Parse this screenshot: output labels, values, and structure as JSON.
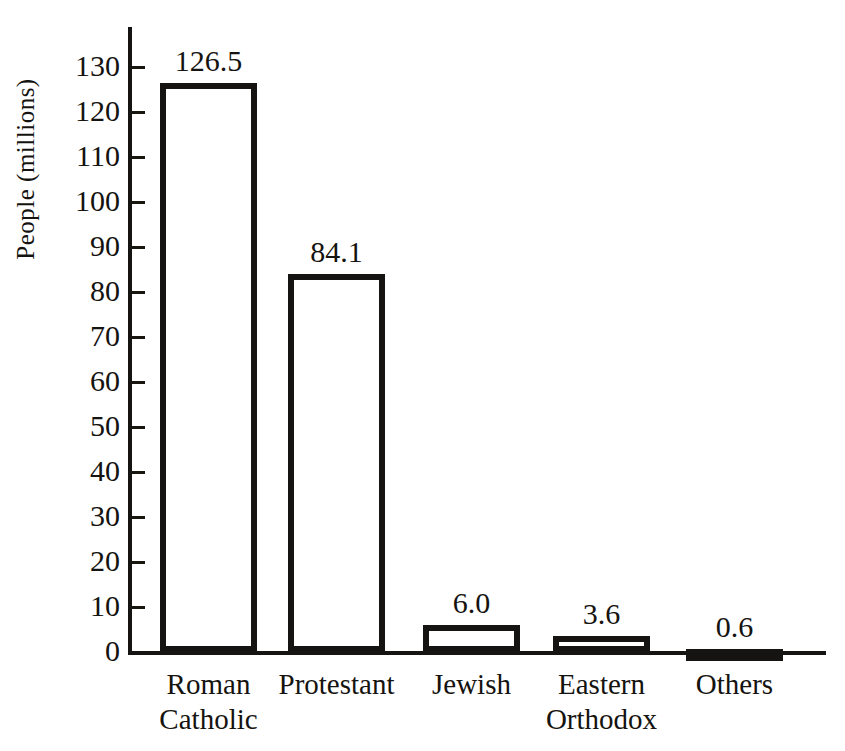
{
  "chart_data": {
    "type": "bar",
    "title": "",
    "xlabel": "",
    "ylabel": "People (millions)",
    "categories": [
      "Roman Catholic",
      "Protestant",
      "Jewish",
      "Eastern Orthodox",
      "Others"
    ],
    "category_lines": [
      [
        "Roman",
        "Catholic"
      ],
      [
        "Protestant"
      ],
      [
        "Jewish"
      ],
      [
        "Eastern",
        "Orthodox"
      ],
      [
        "Others"
      ]
    ],
    "values": [
      126.5,
      84.1,
      6.0,
      3.6,
      0.6
    ],
    "value_labels": [
      "126.5",
      "84.1",
      "6.0",
      "3.6",
      "0.6"
    ],
    "ylim": [
      0,
      130
    ],
    "ytick_step": 10,
    "yticks": [
      0,
      10,
      20,
      30,
      40,
      50,
      60,
      70,
      80,
      90,
      100,
      110,
      120,
      130
    ],
    "ytick_labels": [
      "0",
      "10",
      "20",
      "30",
      "40",
      "50",
      "60",
      "70",
      "80",
      "90",
      "100",
      "110",
      "120",
      "130"
    ],
    "grid": false,
    "legend": null,
    "bar_fill_color": "#ffffff",
    "bar_edge_color": "#161412",
    "axis_color": "#161412",
    "text_color": "#15130f"
  }
}
